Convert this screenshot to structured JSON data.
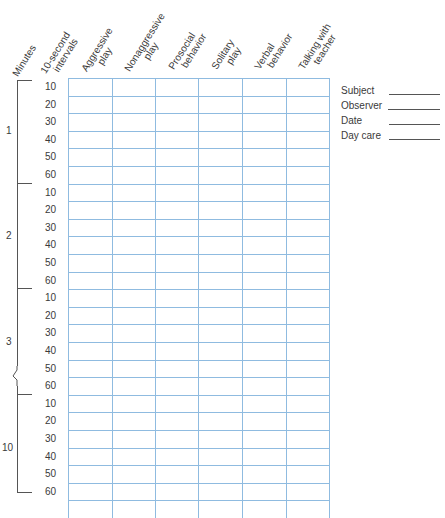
{
  "headers": {
    "minutes": "Minutes",
    "intervals": [
      "10-second",
      "intervals"
    ],
    "columns": [
      {
        "line1": "Aggressive",
        "line2": "play"
      },
      {
        "line1": "Nonaggressive",
        "line2": "play"
      },
      {
        "line1": "Prosocial",
        "line2": "behavior"
      },
      {
        "line1": "Solitary",
        "line2": "play"
      },
      {
        "line1": "Verbal",
        "line2": "behavior"
      },
      {
        "line1": "Talking with",
        "line2": "teacher"
      }
    ]
  },
  "minute_groups": [
    {
      "label": "1",
      "intervals": [
        "10",
        "20",
        "30",
        "40",
        "50",
        "60"
      ]
    },
    {
      "label": "2",
      "intervals": [
        "10",
        "20",
        "30",
        "40",
        "50",
        "60"
      ]
    },
    {
      "label": "3",
      "intervals": [
        "10",
        "20",
        "30",
        "40",
        "50",
        "60"
      ]
    },
    {
      "label": "10",
      "intervals": [
        "10",
        "20",
        "30",
        "40",
        "50",
        "60"
      ]
    }
  ],
  "meta_fields": [
    {
      "label": "Subject"
    },
    {
      "label": "Observer"
    },
    {
      "label": "Date"
    },
    {
      "label": "Day care"
    }
  ],
  "colors": {
    "grid": "#8fbbe0",
    "text": "#3a3a3a",
    "bracket": "#555555"
  }
}
